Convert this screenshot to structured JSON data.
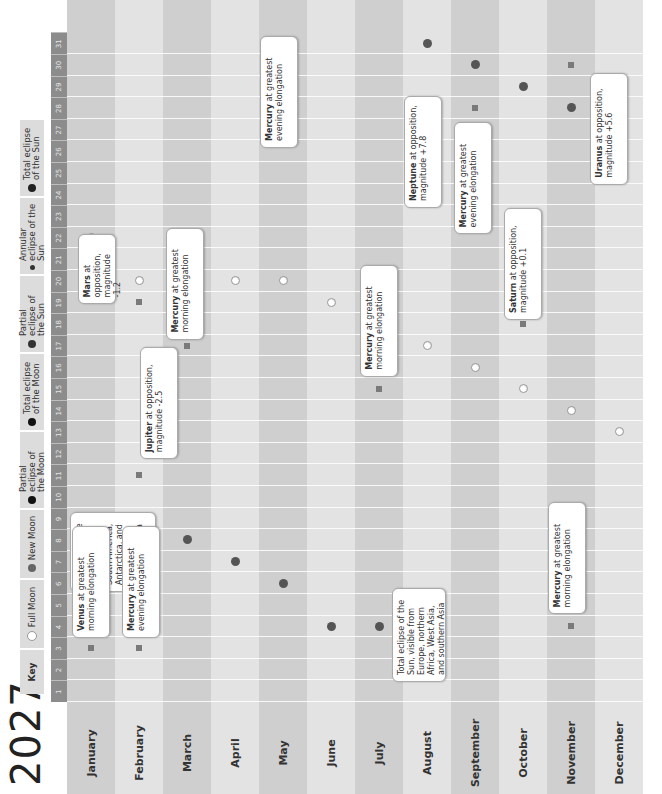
{
  "year": "2027",
  "key": {
    "title": "Key",
    "items": [
      {
        "label": "Full Moon",
        "type": "full"
      },
      {
        "label": "New Moon",
        "type": "new"
      },
      {
        "label": "Partial eclipse of the Moon",
        "type": "partial-lunar"
      },
      {
        "label": "Total eclipse of the Moon",
        "type": "total-lunar"
      },
      {
        "label": "Partial eclipse of the Sun",
        "type": "partial-solar"
      },
      {
        "label": "Annular eclipse of the Sun",
        "type": "annular-solar"
      },
      {
        "label": "Total eclipse of the Sun",
        "type": "total-solar"
      }
    ]
  },
  "months": [
    "January",
    "February",
    "March",
    "April",
    "May",
    "June",
    "July",
    "August",
    "September",
    "October",
    "November",
    "December"
  ],
  "days": [
    1,
    2,
    3,
    4,
    5,
    6,
    7,
    8,
    9,
    10,
    11,
    12,
    13,
    14,
    15,
    16,
    17,
    18,
    19,
    20,
    21,
    22,
    23,
    24,
    25,
    26,
    27,
    28,
    29,
    30,
    31
  ],
  "colors": {
    "shade_dark": "#cfcfcf",
    "shade_light": "#e3e3e3",
    "day_header": "#8c8c8c",
    "marker": "#7a7a7a"
  },
  "chart_data": {
    "type": "table",
    "title": "2027",
    "xlabel": "Day of month",
    "ylabel": "Month",
    "full_moons": [
      {
        "month": "January",
        "day": 22
      },
      {
        "month": "February",
        "day": 20
      },
      {
        "month": "March",
        "day": 22
      },
      {
        "month": "April",
        "day": 20
      },
      {
        "month": "May",
        "day": 20
      },
      {
        "month": "June",
        "day": 19
      },
      {
        "month": "July",
        "day": 18
      },
      {
        "month": "August",
        "day": 17
      },
      {
        "month": "September",
        "day": 16
      },
      {
        "month": "October",
        "day": 15
      },
      {
        "month": "November",
        "day": 14
      },
      {
        "month": "December",
        "day": 13
      }
    ],
    "new_moons": [
      {
        "month": "January",
        "day": 7
      },
      {
        "month": "February",
        "day": 6
      },
      {
        "month": "March",
        "day": 8
      },
      {
        "month": "April",
        "day": 7
      },
      {
        "month": "May",
        "day": 6
      },
      {
        "month": "June",
        "day": 4
      },
      {
        "month": "July",
        "day": 4
      },
      {
        "month": "August",
        "day": 2
      },
      {
        "month": "August",
        "day": 31
      },
      {
        "month": "September",
        "day": 30
      },
      {
        "month": "October",
        "day": 29
      },
      {
        "month": "November",
        "day": 28
      },
      {
        "month": "December",
        "day": 27
      }
    ],
    "eclipses": [
      {
        "month": "February",
        "day": 6,
        "type": "annular-solar",
        "text": "Annular eclipse of the Sun, visible from South America, Antarctica, and western and southern Africa"
      },
      {
        "month": "August",
        "day": 2,
        "type": "total-solar",
        "text": "Total eclipse of the Sun, visible from Europe, northern Africa, West Asia, and southern Asia"
      }
    ],
    "events": [
      {
        "month": "January",
        "day": 3,
        "bold": "Venus",
        "text": " at greatest morning elongation"
      },
      {
        "month": "February",
        "day": 3,
        "bold": "Mercury",
        "text": " at greatest evening elongation"
      },
      {
        "month": "February",
        "day": 11,
        "bold": "Jupiter",
        "text": " at opposition, magnitude -2.5"
      },
      {
        "month": "February",
        "day": 19,
        "bold": "Mars",
        "text": " at opposition, magnitude -1.2"
      },
      {
        "month": "March",
        "day": 17,
        "bold": "Mercury",
        "text": " at greatest morning elongation"
      },
      {
        "month": "May",
        "day": 28,
        "bold": "Mercury",
        "text": " at greatest evening elongation"
      },
      {
        "month": "July",
        "day": 15,
        "bold": "Mercury",
        "text": " at greatest morning elongation"
      },
      {
        "month": "September",
        "day": 24,
        "bold": "Mercury",
        "text": " at greatest evening elongation"
      },
      {
        "month": "September",
        "day": 28,
        "bold": "Neptune",
        "text": " at opposition, magnitude +7.8"
      },
      {
        "month": "October",
        "day": 18,
        "bold": "Saturn",
        "text": " at opposition, magnitude +0.1"
      },
      {
        "month": "November",
        "day": 4,
        "bold": "Mercury",
        "text": " at greatest morning elongation"
      },
      {
        "month": "November",
        "day": 30,
        "bold": "Uranus",
        "text": " at opposition, magnitude +5.6"
      }
    ]
  }
}
